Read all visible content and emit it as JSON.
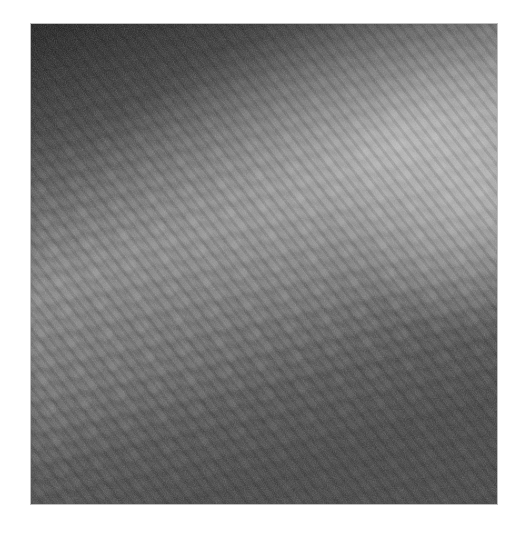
{
  "image": {
    "description": "Grayscale confocal microscopy image showing a mosaic of polygonal cells with a bright diagonal band across the center",
    "alt": "Grayscale micrograph of polygonal cell mosaic",
    "colors": {
      "background": "#ffffff",
      "dark_corner": "#1e1e1e",
      "mid_gray": "#555555",
      "bright_band": "#a8a8a8",
      "cell_border": "#5a5a5a"
    }
  }
}
